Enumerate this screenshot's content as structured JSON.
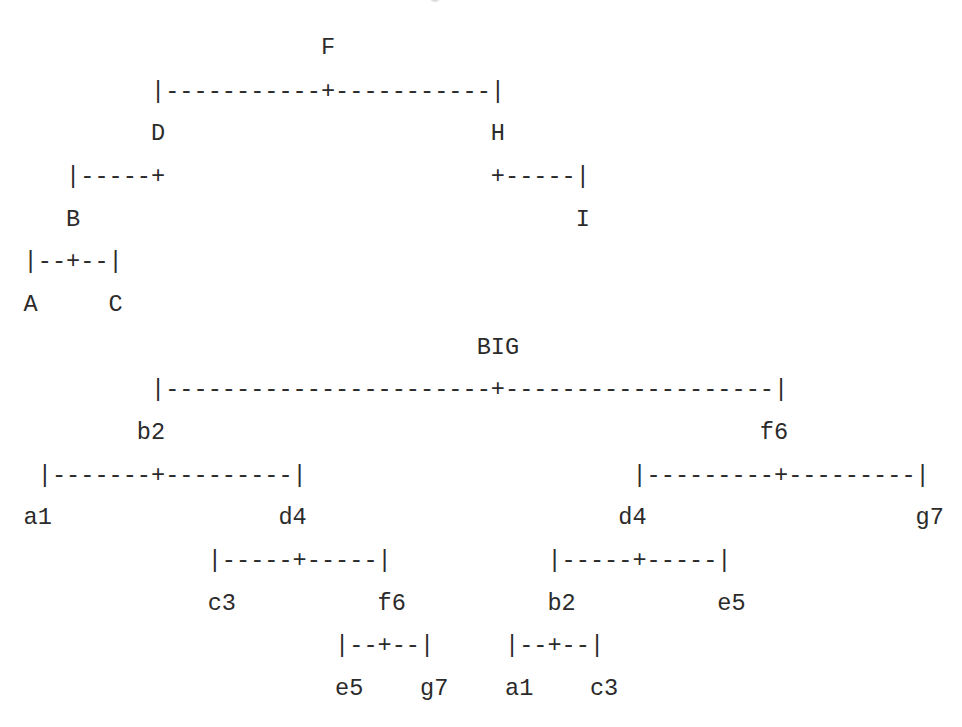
{
  "diagram": {
    "type": "ascii-tree",
    "trees": [
      {
        "name": "letters-tree",
        "root": "F",
        "structure": {
          "F": [
            "D",
            "H"
          ],
          "D": [
            "B",
            null
          ],
          "B": [
            "A",
            "C"
          ],
          "H": [
            null,
            "I"
          ]
        },
        "lines": [
          "                     F",
          "         |-----------+-----------|",
          "         D                       H",
          "   |-----+                       +-----|",
          "   B                                   I",
          "|--+--|",
          "A     C"
        ]
      },
      {
        "name": "big-tree",
        "root": "BIG",
        "structure": {
          "BIG": [
            "b2",
            "f6"
          ],
          "b2": [
            "a1",
            "d4"
          ],
          "d4": [
            "c3",
            "f6"
          ],
          "f6(left)": [
            "e5",
            "g7"
          ],
          "f6": [
            "d4",
            "g7"
          ],
          "d4(right)": [
            "b2",
            "e5"
          ],
          "b2(right)": [
            "a1",
            "c3"
          ]
        },
        "lines": [
          "                                BIG",
          "         |-----------------------+-------------------|",
          "        b2                                          f6",
          " |-------+---------|                       |---------+---------|",
          "a1                d4                      d4                   g7",
          "             |-----+-----|           |-----+-----|",
          "             c3          f6          b2          e5",
          "                      |--+--|     |--+--|",
          "                      e5    g7    a1    c3"
        ]
      }
    ]
  },
  "style": {
    "text_color": "#2b2b2b",
    "background": "#ffffff"
  }
}
